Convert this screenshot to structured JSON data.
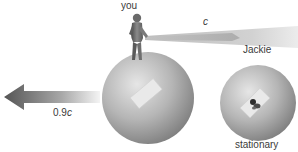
{
  "diagram": {
    "labels": {
      "you": "you",
      "light_speed": "c",
      "jackie": "Jackie",
      "velocity_number": "0.9",
      "velocity_unit": "c",
      "stationary": "stationary"
    },
    "colors": {
      "background": "#ffffff",
      "sphere_light": "#e4e4e4",
      "sphere_mid": "#b3b3b3",
      "sphere_dark": "#7c7c7c",
      "arrow_dark": "#5a5a5a",
      "arrow_light": "#f2f2f2",
      "beam": "#c8c8c8",
      "text": "#3a3a3a"
    }
  }
}
